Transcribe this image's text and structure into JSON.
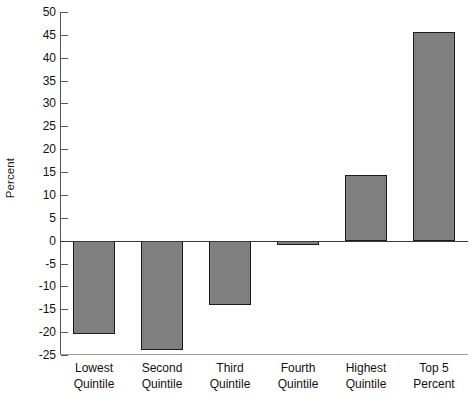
{
  "chart_data": {
    "type": "bar",
    "title": "",
    "xlabel": "",
    "ylabel": "Percent",
    "categories": [
      "Lowest Quintile",
      "Second Quintile",
      "Third Quintile",
      "Fourth Quintile",
      "Highest Quintile",
      "Top 5 Percent"
    ],
    "category_lines": [
      [
        "Lowest",
        "Quintile"
      ],
      [
        "Second",
        "Quintile"
      ],
      [
        "Third",
        "Quintile"
      ],
      [
        "Fourth",
        "Quintile"
      ],
      [
        "Highest",
        "Quintile"
      ],
      [
        "Top 5",
        "Percent"
      ]
    ],
    "values": [
      -20.5,
      -24.0,
      -14.0,
      -1.0,
      14.4,
      45.7
    ],
    "ylim": [
      -25,
      50
    ],
    "ytick_labels": [
      "50",
      "45",
      "40",
      "35",
      "30",
      "25",
      "20",
      "15",
      "10",
      "5",
      "0",
      "-5",
      "-10",
      "-15",
      "-20",
      "-25"
    ],
    "ytick_values": [
      50,
      45,
      40,
      35,
      30,
      25,
      20,
      15,
      10,
      5,
      0,
      -5,
      -10,
      -15,
      -20,
      -25
    ],
    "grid": false,
    "legend": null,
    "bar_color": "#808080",
    "bar_edge_color": "#1c1c1c",
    "zero_line_color": "#3a3a3a",
    "axis_color": "#4d4d4d"
  }
}
